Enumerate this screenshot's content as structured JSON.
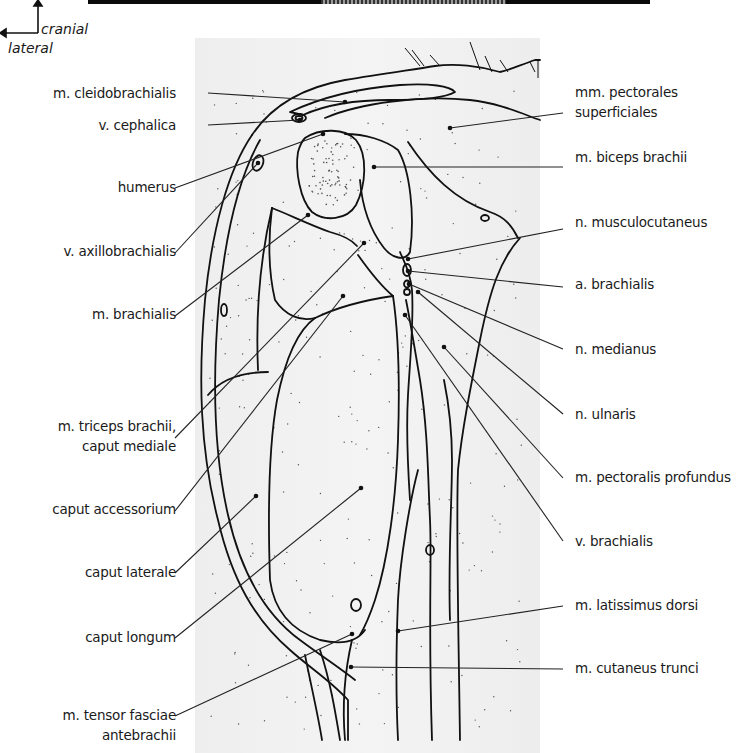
{
  "figure": {
    "orientation": {
      "cranial_label": "cranial",
      "lateral_label": "lateral"
    },
    "labels_left": [
      {
        "id": "cleidobrachialis",
        "lines": [
          "m. cleidobrachialis"
        ],
        "x": 192,
        "y": 83,
        "line": [
          208,
          93,
          345,
          102
        ]
      },
      {
        "id": "cephalica",
        "lines": [
          "v. cephalica"
        ],
        "x": 192,
        "y": 115,
        "line": [
          208,
          125,
          300,
          120
        ]
      },
      {
        "id": "humerus",
        "lines": [
          "humerus"
        ],
        "x": 192,
        "y": 177,
        "line": [
          175,
          188,
          323,
          134
        ]
      },
      {
        "id": "axillobrachialis",
        "lines": [
          "v. axillobrachialis"
        ],
        "x": 192,
        "y": 241,
        "line": [
          175,
          253,
          258,
          163
        ]
      },
      {
        "id": "brachialis",
        "lines": [
          "m. brachialis"
        ],
        "x": 192,
        "y": 304,
        "line": [
          175,
          316,
          308,
          215
        ]
      },
      {
        "id": "triceps-mediale",
        "lines": [
          "m. triceps brachii,",
          "caput mediale"
        ],
        "x": 192,
        "y": 416,
        "line": [
          175,
          438,
          364,
          243
        ]
      },
      {
        "id": "accessorium",
        "lines": [
          "caput accessorium"
        ],
        "x": 192,
        "y": 499,
        "line": [
          175,
          511,
          343,
          296
        ]
      },
      {
        "id": "laterale",
        "lines": [
          "caput laterale"
        ],
        "x": 192,
        "y": 562,
        "line": [
          175,
          573,
          256,
          496
        ]
      },
      {
        "id": "longum",
        "lines": [
          "caput longum"
        ],
        "x": 192,
        "y": 627,
        "line": [
          175,
          638,
          361,
          488
        ]
      },
      {
        "id": "tensor",
        "lines": [
          "m. tensor fasciae",
          "antebrachii"
        ],
        "x": 192,
        "y": 705,
        "line": [
          175,
          716,
          352,
          634
        ]
      }
    ],
    "labels_right": [
      {
        "id": "pectorales-superficiales",
        "lines": [
          "mm. pectorales",
          "superficiales"
        ],
        "x": 575,
        "y": 82,
        "line": [
          563,
          113,
          450,
          128
        ]
      },
      {
        "id": "biceps",
        "lines": [
          "m. biceps brachii"
        ],
        "x": 575,
        "y": 147,
        "line": [
          563,
          167,
          374,
          167
        ]
      },
      {
        "id": "musculocutaneus",
        "lines": [
          "n. musculocutaneus"
        ],
        "x": 575,
        "y": 212,
        "line": [
          563,
          229,
          408,
          259
        ]
      },
      {
        "id": "a-brachialis",
        "lines": [
          "a. brachialis"
        ],
        "x": 575,
        "y": 274,
        "line": [
          563,
          287,
          408,
          271
        ]
      },
      {
        "id": "medianus",
        "lines": [
          "n. medianus"
        ],
        "x": 575,
        "y": 339,
        "line": [
          563,
          349,
          409,
          284
        ]
      },
      {
        "id": "ulnaris",
        "lines": [
          "n. ulnaris"
        ],
        "x": 575,
        "y": 404,
        "line": [
          563,
          414,
          418,
          292
        ]
      },
      {
        "id": "pectoralis-profundus",
        "lines": [
          "m. pectoralis profundus"
        ],
        "x": 575,
        "y": 467,
        "line": [
          563,
          478,
          444,
          347
        ]
      },
      {
        "id": "v-brachialis",
        "lines": [
          "v. brachialis"
        ],
        "x": 575,
        "y": 531,
        "line": [
          563,
          541,
          405,
          315
        ]
      },
      {
        "id": "latissimus",
        "lines": [
          "m. latissimus dorsi"
        ],
        "x": 575,
        "y": 595,
        "line": [
          563,
          606,
          398,
          631
        ]
      },
      {
        "id": "cutaneus-trunci",
        "lines": [
          "m. cutaneus trunci"
        ],
        "x": 575,
        "y": 658,
        "line": [
          563,
          669,
          351,
          667
        ]
      }
    ],
    "colors": {
      "ink": "#111111",
      "panel": "#f0f0f0",
      "background": "#ffffff"
    }
  }
}
